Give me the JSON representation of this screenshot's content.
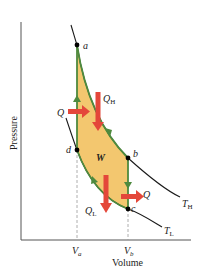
{
  "diagram": {
    "type": "pv-diagram",
    "cycle": "Stirling",
    "axes": {
      "xlabel": "Volume",
      "ylabel": "Pressure",
      "x_ticks": [
        {
          "label": "V",
          "sub": "a"
        },
        {
          "label": "V",
          "sub": "b"
        }
      ]
    },
    "points": [
      {
        "id": "a",
        "label": "a"
      },
      {
        "id": "b",
        "label": "b"
      },
      {
        "id": "c",
        "label": "c"
      },
      {
        "id": "d",
        "label": "d"
      }
    ],
    "isotherms": [
      {
        "label": "T",
        "sub": "H"
      },
      {
        "label": "T",
        "sub": "L"
      }
    ],
    "heat_labels": {
      "q_left": "Q",
      "q_h": "Q",
      "q_h_sub": "H",
      "q_l": "Q",
      "q_l_sub": "L",
      "q_right": "Q"
    },
    "work_label": "W",
    "colors": {
      "fill": "#f2c15f",
      "cycle_line": "#4e8a3e",
      "heat_arrow": "#e4473a",
      "isotherm": "#1a1a1a",
      "axis": "#444444"
    }
  }
}
